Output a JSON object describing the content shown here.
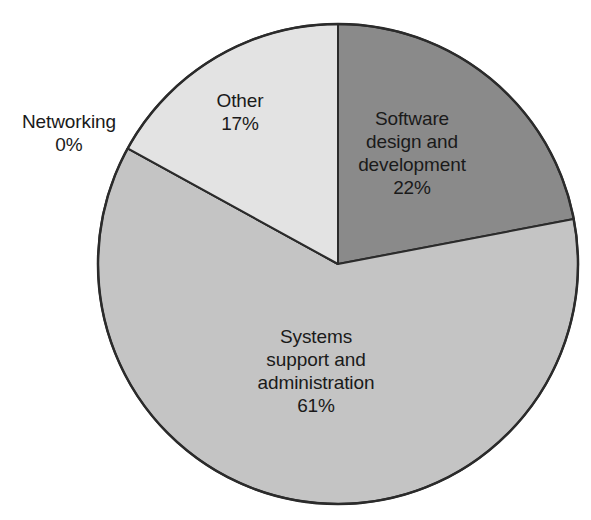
{
  "chart_data": {
    "type": "pie",
    "title": "",
    "subtitle": "",
    "xlabel": "",
    "ylabel": "",
    "legend_position": "none",
    "grid": false,
    "units": "percent",
    "start_angle_deg": 0,
    "direction": "clockwise",
    "categories": [
      "Software design and development",
      "Systems support and administration",
      "Networking",
      "Other"
    ],
    "values": [
      22,
      61,
      0,
      17
    ],
    "colors": [
      "#8a8a8a",
      "#c4c4c4",
      "#c4c4c4",
      "#e3e3e3"
    ],
    "stroke_color": "#2b2b2b",
    "slices": [
      {
        "name": "Software design and development",
        "value": 22,
        "value_label": "22%",
        "color": "#8a8a8a",
        "label_lines": "Software\ndesign and\ndevelopment\n22%",
        "label_placement": "inside"
      },
      {
        "name": "Systems support and administration",
        "value": 61,
        "value_label": "61%",
        "color": "#c4c4c4",
        "label_lines": "Systems\nsupport and\nadministration\n61%",
        "label_placement": "inside"
      },
      {
        "name": "Networking",
        "value": 0,
        "value_label": "0%",
        "color": "#c4c4c4",
        "label_lines": "Networking\n0%",
        "label_placement": "outside-left"
      },
      {
        "name": "Other",
        "value": 17,
        "value_label": "17%",
        "color": "#e3e3e3",
        "label_lines": "Other\n17%",
        "label_placement": "inside"
      }
    ]
  },
  "geometry": {
    "center_x": 338,
    "center_y": 264,
    "radius": 240
  },
  "labels": {
    "networking": "Networking\n0%",
    "other": "Other\n17%",
    "software": "Software\ndesign and\ndevelopment\n22%",
    "systems": "Systems\nsupport and\nadministration\n61%"
  }
}
